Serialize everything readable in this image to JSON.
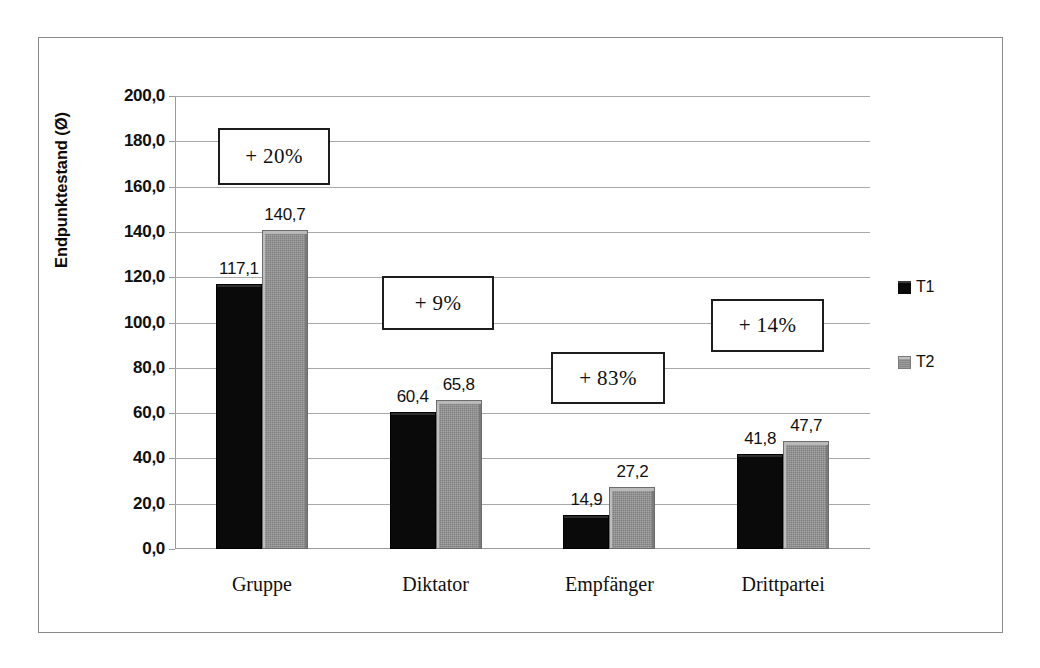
{
  "chart_data": {
    "type": "bar",
    "title": "",
    "subtitle": "",
    "xlabel": "",
    "ylabel": "Endpunktestand (Ø)",
    "ylim": [
      0,
      200
    ],
    "ytick_step": 20,
    "grid": true,
    "legend_position": "right",
    "categories": [
      "Gruppe",
      "Diktator",
      "Empfänger",
      "Drittpartei"
    ],
    "series": [
      {
        "name": "T1",
        "color": "#0a0a0a",
        "values": [
          117.1,
          60.4,
          14.9,
          41.8
        ],
        "value_labels": [
          "117,1",
          "60,4",
          "14,9",
          "41,8"
        ]
      },
      {
        "name": "T2",
        "color": "#8e8e8e",
        "values": [
          140.7,
          65.8,
          27.2,
          47.7
        ],
        "value_labels": [
          "140,7",
          "65,8",
          "27,2",
          "47,7"
        ]
      }
    ],
    "ytick_labels": [
      "200,0",
      "180,0",
      "160,0",
      "140,0",
      "120,0",
      "100,0",
      "80,0",
      "60,0",
      "40,0",
      "20,0",
      "0,0"
    ],
    "ytick_values": [
      200,
      180,
      160,
      140,
      120,
      100,
      80,
      60,
      40,
      20,
      0
    ],
    "annotations": [
      {
        "text": "+ 20%",
        "category": "Gruppe",
        "x": 218,
        "y": 128,
        "w": 112,
        "h": 57
      },
      {
        "text": "+ 9%",
        "category": "Diktator",
        "x": 382,
        "y": 276,
        "w": 112,
        "h": 54
      },
      {
        "text": "+ 83%",
        "category": "Empfänger",
        "x": 551,
        "y": 352,
        "w": 114,
        "h": 52
      },
      {
        "text": "+ 14%",
        "category": "Drittpartei",
        "x": 711,
        "y": 299,
        "w": 113,
        "h": 53
      }
    ]
  },
  "legend": {
    "items": [
      {
        "label": "T1",
        "swatch": "t1"
      },
      {
        "label": "T2",
        "swatch": "t2"
      }
    ]
  }
}
